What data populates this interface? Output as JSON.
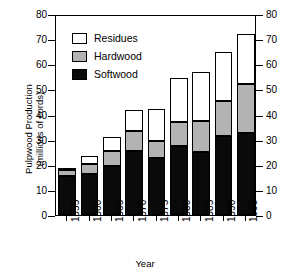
{
  "chart_data": {
    "type": "bar",
    "stacked": true,
    "title": "",
    "xlabel": "Year",
    "ylabel": "Pulpwood Production (millions of cords)",
    "ylabel_line1": "Pulpwood Production",
    "ylabel_line2": "(millions of cords)",
    "categories": [
      "1955",
      "1960",
      "1965",
      "1970",
      "1975",
      "1980",
      "1985",
      "1990",
      "1995"
    ],
    "series": [
      {
        "name": "Softwood",
        "color": "#0a0a0a",
        "values": [
          15.5,
          16.5,
          19.5,
          25.5,
          22.5,
          27.5,
          25.0,
          31.5,
          32.5
        ]
      },
      {
        "name": "Hardwood",
        "color": "#b3b3b3",
        "values": [
          2.5,
          4.0,
          6.0,
          8.0,
          7.0,
          9.5,
          12.5,
          14.0,
          19.5
        ]
      },
      {
        "name": "Residues",
        "color": "#ffffff",
        "values": [
          0.5,
          3.0,
          5.5,
          8.5,
          12.5,
          17.5,
          19.5,
          19.5,
          20.0
        ]
      }
    ],
    "totals": [
      18.5,
      23.5,
      31.0,
      42.0,
      42.0,
      54.5,
      57.0,
      65.0,
      72.0
    ],
    "ylim": [
      0,
      80
    ],
    "yticks": [
      0,
      10,
      20,
      30,
      40,
      50,
      60,
      70,
      80
    ],
    "yticks_right": [
      0,
      10,
      20,
      30,
      40,
      50,
      60,
      70,
      80
    ],
    "grid": false,
    "legend_position": "top-left",
    "legend": [
      "Residues",
      "Hardwood",
      "Softwood"
    ]
  },
  "axes": {
    "left_tick_labels": [
      "80",
      "70",
      "60",
      "50",
      "40",
      "30",
      "20",
      "10",
      "0"
    ],
    "right_tick_labels": [
      "80",
      "70",
      "60",
      "50",
      "40",
      "30",
      "20",
      "10",
      "0"
    ]
  }
}
